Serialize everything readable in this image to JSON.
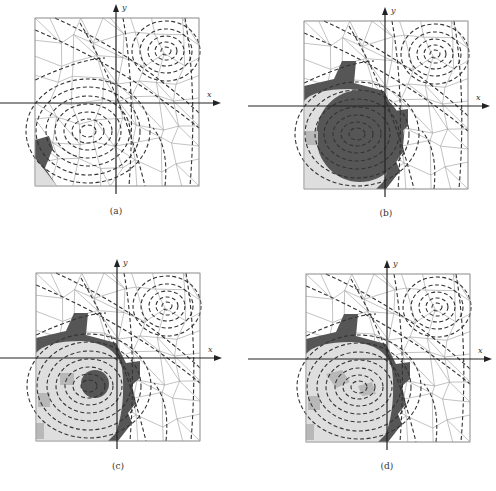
{
  "figure": {
    "caption": "",
    "colors": {
      "mesh_line": "#9a9a9a",
      "contour": "#333333",
      "axis": "#222222",
      "dark_fill": "#565656",
      "mid_fill": "#b8b8b8",
      "light_fill": "#dedede",
      "frame": "#999999"
    },
    "axes": {
      "x_label": "x",
      "y_label": "y"
    },
    "panels": [
      {
        "id": "a",
        "label": "(a)",
        "description": "Voronoi mesh with dashed contour lines of two vortices; only lower-left corner cells shaded"
      },
      {
        "id": "b",
        "label": "(b)",
        "description": "Mesh with large dark-shaded region around lower-left vortex, light-gray ring outside"
      },
      {
        "id": "c",
        "label": "(c)",
        "description": "Mesh with dark outer band, light-gray interior and small dark core at lower-left vortex center"
      },
      {
        "id": "d",
        "label": "(d)",
        "description": "Mesh with dark outer band, light-gray interior with mid-gray cells near vortex center"
      }
    ]
  }
}
